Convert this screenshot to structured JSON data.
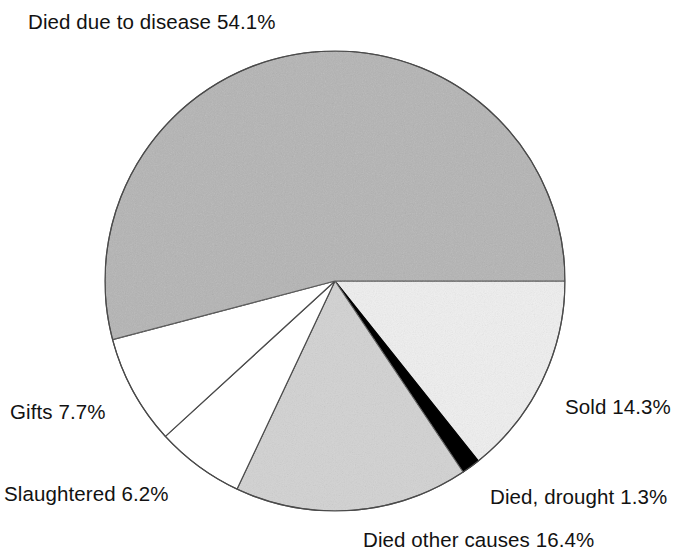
{
  "chart_data": {
    "type": "pie",
    "title": "",
    "subtitle": "",
    "xlabel": "",
    "ylabel": "",
    "grid": false,
    "legend_position": "none",
    "label_format": "{name} {value}%",
    "units": "percent",
    "start_angle_deg": 0,
    "direction": "clockwise",
    "center": {
      "x": 335,
      "y": 281
    },
    "radius": 230,
    "categories": [
      "Sold",
      "Died, drought",
      "Died other causes",
      "Slaughtered",
      "Gifts",
      "Died due to disease"
    ],
    "values": [
      14.3,
      1.3,
      16.4,
      6.2,
      7.7,
      54.1
    ],
    "colors": [
      "#efefef",
      "#000000",
      "#d2d2d2",
      "#ffffff",
      "#ffffff",
      "#b4b4b4"
    ],
    "slices": [
      {
        "name": "Sold",
        "value": 14.3,
        "label": "Sold 14.3%",
        "color": "#efefef",
        "stroke": "#4a4a4a",
        "start_deg": 0,
        "sweep_deg": 51.48
      },
      {
        "name": "Died, drought",
        "value": 1.3,
        "label": "Died, drought 1.3%",
        "color": "#000000",
        "stroke": "#000000",
        "start_deg": 51.48,
        "sweep_deg": 4.68
      },
      {
        "name": "Died other causes",
        "value": 16.4,
        "label": "Died other causes 16.4%",
        "color": "#d2d2d2",
        "stroke": "#4a4a4a",
        "start_deg": 56.16,
        "sweep_deg": 59.04
      },
      {
        "name": "Slaughtered",
        "value": 6.2,
        "label": "Slaughtered 6.2%",
        "color": "#ffffff",
        "stroke": "#4a4a4a",
        "start_deg": 115.2,
        "sweep_deg": 22.32
      },
      {
        "name": "Gifts",
        "value": 7.7,
        "label": "Gifts 7.7%",
        "color": "#ffffff",
        "stroke": "#4a4a4a",
        "start_deg": 137.52,
        "sweep_deg": 27.72
      },
      {
        "name": "Died due to disease",
        "value": 54.1,
        "label": "Died due to disease 54.1%",
        "color": "#b4b4b4",
        "stroke": "#4a4a4a",
        "start_deg": 165.24,
        "sweep_deg": 194.76
      }
    ]
  },
  "labels": {
    "disease": "Died due to disease 54.1%",
    "gifts": "Gifts 7.7%",
    "slaughtered": "Slaughtered 6.2%",
    "sold": "Sold 14.3%",
    "drought": "Died, drought 1.3%",
    "other_causes": "Died other causes 16.4%"
  }
}
